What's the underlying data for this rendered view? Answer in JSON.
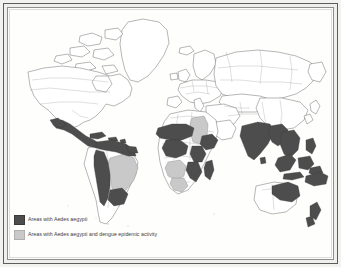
{
  "figure": {
    "kind": "world-distribution-map",
    "frame_style": "double-rule-scanned-page"
  },
  "colors": {
    "endemic_fill": "#4d4d4d",
    "epidemic_fill": "#c9c9c9",
    "coastline": "#5a5a5a",
    "border_line": "#8e8e8e",
    "page_background": "#fefefd",
    "frame_outer": "#5d5d5d",
    "frame_inner": "#8e8e8e"
  },
  "legend": {
    "items": [
      {
        "swatch": "dark-gray-swatch",
        "label": "Areas with Aedes aegypti"
      },
      {
        "swatch": "light-gray-swatch",
        "label": "Areas with Aedes aegypti and dengue epidemic activity"
      }
    ]
  },
  "map": {
    "projection_note": "world, equirectangular",
    "regions_endemic": [
      "Mexico (coastal)",
      "Central America",
      "Caribbean",
      "Colombia",
      "Venezuela",
      "Guyana",
      "Ecuador",
      "Peru",
      "Bolivia",
      "Paraguay",
      "northern Argentina",
      "West Africa",
      "Ethiopia",
      "Somalia",
      "Kenya",
      "Tanzania",
      "Mozambique",
      "Zimbabwe",
      "Madagascar",
      "India",
      "Bangladesh",
      "Myanmar",
      "Thailand",
      "Vietnam",
      "Malaysia",
      "Indonesia",
      "Philippines",
      "Papua New Guinea",
      "northern Australia",
      "New Zealand"
    ],
    "regions_epidemic": [
      "Brazil",
      "Egypt",
      "Sudan",
      "Angola",
      "Zambia",
      "Botswana",
      "South Africa"
    ],
    "regions_unshaded": [
      "Canada",
      "Greenland",
      "United States (interior)",
      "Europe",
      "Russia",
      "China",
      "Mongolia",
      "Central Asia",
      "Chile",
      "southern Argentina"
    ]
  }
}
